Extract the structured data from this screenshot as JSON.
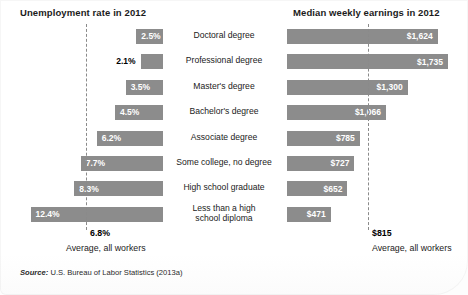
{
  "figure": {
    "left_title": "Unemployment rate in 2012",
    "right_title": "Median weekly earnings in 2012",
    "source_label": "Source:",
    "source_text": " U.S. Bureau of Labor Statistics (2013a)",
    "bar_color": "#8c8c8c",
    "average_line_color": "#8a8a8a",
    "left_average_value": "6.8%",
    "left_average_caption": "Average, all workers",
    "right_average_value": "$815",
    "right_average_caption": "Average, all workers"
  },
  "chart_data": {
    "type": "bar",
    "orientation": "horizontal",
    "layout": "paired back-to-back panels; left panel bars grow leftward, right panel bars grow rightward",
    "grid": false,
    "legend": "none",
    "categories": [
      "Doctoral degree",
      "Professional degree",
      "Master's degree",
      "Bachelor's degree",
      "Associate degree",
      "Some college, no degree",
      "High school graduate",
      "Less than a high school diploma"
    ],
    "series": [
      {
        "name": "Unemployment rate in 2012",
        "panel": "left",
        "unit": "percent",
        "xlabel": "Unemployment rate in 2012",
        "values": [
          2.5,
          2.1,
          3.5,
          4.5,
          6.2,
          7.7,
          8.3,
          12.4
        ],
        "labels": [
          "2.5%",
          "2.1%",
          "3.5%",
          "4.5%",
          "6.2%",
          "7.7%",
          "8.3%",
          "12.4%"
        ],
        "xlim": [
          0,
          13.2
        ],
        "reference_line": {
          "value": 6.8,
          "label": "6.8%",
          "caption": "Average, all workers"
        }
      },
      {
        "name": "Median weekly earnings in 2012",
        "panel": "right",
        "unit": "US dollars per week",
        "xlabel": "Median weekly earnings in 2012",
        "values": [
          1624,
          1735,
          1300,
          1066,
          785,
          727,
          652,
          471
        ],
        "labels": [
          "$1,624",
          "$1,735",
          "$1,300",
          "$1,066",
          "$785",
          "$727",
          "$652",
          "$471"
        ],
        "xlim": [
          0,
          1800
        ],
        "reference_line": {
          "value": 815,
          "label": "$815",
          "caption": "Average, all workers"
        }
      }
    ],
    "source": "Source: U.S. Bureau of Labor Statistics (2013a)"
  },
  "rows": [
    {
      "category": "Doctoral degree",
      "two_line": false,
      "unemp_label": "2.5%",
      "unemp_inside": true,
      "earn_label": "$1,624"
    },
    {
      "category": "Professional degree",
      "two_line": false,
      "unemp_label": "2.1%",
      "unemp_inside": false,
      "earn_label": "$1,735"
    },
    {
      "category": "Master's degree",
      "two_line": false,
      "unemp_label": "3.5%",
      "unemp_inside": true,
      "earn_label": "$1,300"
    },
    {
      "category": "Bachelor's degree",
      "two_line": false,
      "unemp_label": "4.5%",
      "unemp_inside": true,
      "earn_label": "$1,066"
    },
    {
      "category": "Associate degree",
      "two_line": false,
      "unemp_label": "6.2%",
      "unemp_inside": true,
      "earn_label": "$785"
    },
    {
      "category": "Some college, no degree",
      "two_line": false,
      "unemp_label": "7.7%",
      "unemp_inside": true,
      "earn_label": "$727"
    },
    {
      "category": "High school graduate",
      "two_line": false,
      "unemp_label": "8.3%",
      "unemp_inside": true,
      "earn_label": "$652"
    },
    {
      "category": "Less than a high\nschool diploma",
      "two_line": true,
      "unemp_label": "12.4%",
      "unemp_inside": true,
      "earn_label": "$471"
    }
  ]
}
